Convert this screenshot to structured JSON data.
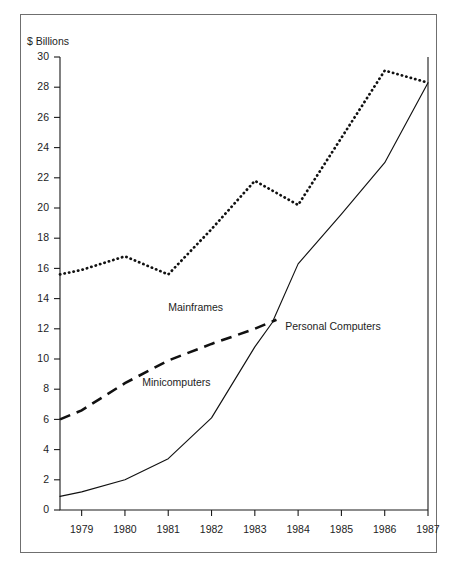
{
  "chart_data": {
    "type": "line",
    "title": "",
    "subtitle": "",
    "xlabel": "",
    "ylabel": "$ Billions",
    "ylim": [
      0,
      30
    ],
    "xlim": [
      1978.5,
      1987
    ],
    "grid": false,
    "legend_position": "inline-annotations",
    "y_ticks": [
      0,
      2,
      4,
      6,
      8,
      10,
      12,
      14,
      16,
      18,
      20,
      22,
      24,
      26,
      28,
      30
    ],
    "y_tick_labels": [
      "0",
      "2",
      "4",
      "6",
      "8",
      "10",
      "12",
      "14",
      "16",
      "18",
      "20",
      "22",
      "24",
      "26",
      "28",
      "30"
    ],
    "x_ticks": [
      1979,
      1980,
      1981,
      1982,
      1983,
      1984,
      1985,
      1986,
      1987
    ],
    "x_tick_labels": [
      "1979",
      "1980",
      "1981",
      "1982",
      "1983",
      "1984",
      "1985",
      "1986",
      "1987"
    ],
    "series": [
      {
        "name": "Mainframes",
        "style": "dotted",
        "x": [
          1978.5,
          1979,
          1980,
          1981,
          1982,
          1983,
          1984,
          1986,
          1987
        ],
        "values": [
          15.6,
          15.9,
          16.8,
          15.6,
          18.6,
          21.8,
          20.2,
          29.1,
          28.3
        ],
        "label_x": 1981.0,
        "label_y": 13.2
      },
      {
        "name": "Minicomputers",
        "style": "dashed",
        "x": [
          1978.5,
          1979,
          1980,
          1981,
          1982,
          1983,
          1983.5
        ],
        "values": [
          6.0,
          6.6,
          8.4,
          9.9,
          11.0,
          12.0,
          12.6
        ],
        "label_x": 1980.4,
        "label_y": 8.2
      },
      {
        "name": "Personal Computers",
        "style": "solid",
        "x": [
          1978.5,
          1979,
          1980,
          1981,
          1982,
          1983,
          1983.4,
          1984,
          1985,
          1986,
          1987
        ],
        "values": [
          0.9,
          1.2,
          2.0,
          3.4,
          6.1,
          10.8,
          12.4,
          16.3,
          19.6,
          23.0,
          28.3
        ],
        "label_x": 1983.7,
        "label_y": 11.9
      }
    ],
    "annotations": [
      {
        "text": "Mainframes"
      },
      {
        "text": "Minicomputers"
      },
      {
        "text": "Personal Computers"
      }
    ]
  },
  "axis": {
    "y_title": "$ Billions"
  }
}
